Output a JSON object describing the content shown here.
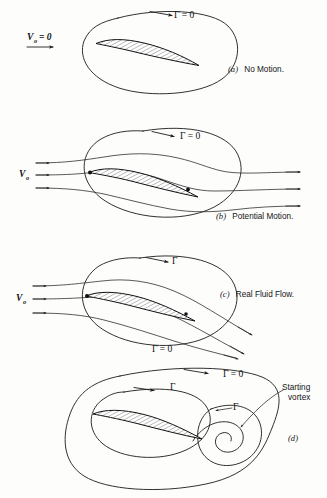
{
  "figure": {
    "background_color": "#fdfdfc",
    "ink_color": "#1b1b1b"
  },
  "panels": [
    {
      "id": "a",
      "caption": "(a)  No Motion.",
      "caption_marker": "(a)",
      "caption_text": "No Motion.",
      "velocity_label": "V",
      "velocity_subscript": "o",
      "velocity_value": "= 0",
      "circulation_labels": [
        {
          "text": "Γ = 0",
          "symbol": "Γ",
          "value": "0"
        }
      ],
      "streamline_count": 0,
      "description": "Airfoil at rest inside a closed fluid circuit; no motion, zero circulation."
    },
    {
      "id": "b",
      "caption": "(b)  Potential Motion.",
      "caption_marker": "(b)",
      "caption_text": "Potential Motion.",
      "velocity_label": "V",
      "velocity_subscript": "o",
      "velocity_value": "",
      "circulation_labels": [
        {
          "text": "Γ = 0",
          "symbol": "Γ",
          "value": "0"
        }
      ],
      "streamline_count": 3,
      "description": "Ideal potential flow past the airfoil, streamlines leave horizontally, circulation still zero."
    },
    {
      "id": "c",
      "caption": "(c)  Real Fluid Flow.",
      "caption_marker": "(c)",
      "caption_text": "Real Fluid Flow.",
      "velocity_label": "V",
      "velocity_subscript": "o",
      "velocity_value": "",
      "circulation_labels": [
        {
          "text": "Γ",
          "symbol": "Γ",
          "value": ""
        },
        {
          "text": "Γ = 0",
          "symbol": "Γ",
          "value": "0"
        }
      ],
      "streamline_count": 3,
      "description": "Real viscous flow with downwash; circulation about the airfoil circuit is non-zero."
    },
    {
      "id": "d",
      "caption": "(d)",
      "caption_marker": "(d)",
      "caption_text": "",
      "velocity_label": "",
      "velocity_subscript": "",
      "velocity_value": "",
      "circulation_labels": [
        {
          "text": "Γ = 0",
          "symbol": "Γ",
          "value": "0"
        },
        {
          "text": "Γ",
          "symbol": "Γ",
          "value": ""
        },
        {
          "text": "Γ",
          "symbol": "Γ",
          "value": ""
        }
      ],
      "annotation": "Starting\nvortex",
      "annotation_line1": "Starting",
      "annotation_line2": "vortex",
      "streamline_count": 0,
      "description": "Outer circuit has zero circulation; it encloses the bound vortex about the airfoil and the equal and opposite starting vortex."
    }
  ],
  "symbols": {
    "gamma": "Γ",
    "gamma_zero": "Γ = 0",
    "velocity_freestream": "V",
    "velocity_subscript": "o",
    "velocity_zero": "= 0"
  }
}
